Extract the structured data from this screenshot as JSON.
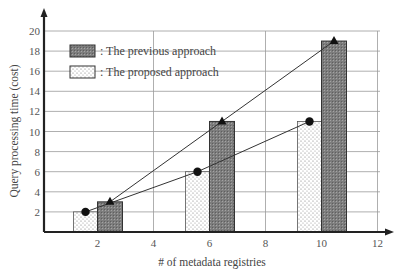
{
  "chart_data": {
    "type": "bar",
    "title": "",
    "xlabel": "# of metadata registries",
    "ylabel": "Query processing time (cost)",
    "x_ticks": [
      "2",
      "4",
      "6",
      "8",
      "10",
      "12"
    ],
    "y_ticks": [
      "2",
      "4",
      "6",
      "8",
      "10",
      "12",
      "14",
      "16",
      "18",
      "20"
    ],
    "xlim": [
      0,
      12
    ],
    "ylim": [
      0,
      20
    ],
    "grid": true,
    "legend_position": "upper-left",
    "categories": [
      2,
      6,
      10
    ],
    "series": [
      {
        "name": "The previous approach",
        "legend_label": ": The previous approach",
        "values": [
          3,
          11,
          19
        ],
        "style": "dark-crosshatch",
        "marker": "triangle",
        "color": "#8a8a8a"
      },
      {
        "name": "The proposed approach",
        "legend_label": ": The proposed approach",
        "values": [
          2,
          6,
          11
        ],
        "style": "dotted",
        "marker": "circle",
        "color": "#ffffff"
      }
    ],
    "overlay_lines": [
      {
        "series": "The previous approach",
        "points": [
          [
            2,
            3
          ],
          [
            6,
            11
          ],
          [
            10,
            19
          ]
        ],
        "marker": "triangle"
      },
      {
        "series": "The proposed approach",
        "points": [
          [
            2,
            2
          ],
          [
            6,
            6
          ],
          [
            10,
            11
          ]
        ],
        "marker": "circle"
      }
    ]
  }
}
